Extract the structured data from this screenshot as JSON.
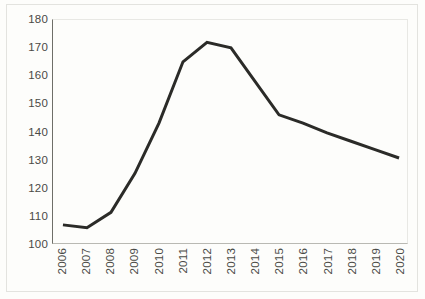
{
  "chart_data": {
    "type": "line",
    "title": "",
    "subtitle": "",
    "xlabel": "",
    "ylabel": "",
    "categories": [
      "2006",
      "2007",
      "2008",
      "2009",
      "2010",
      "2011",
      "2012",
      "2013",
      "2014",
      "2015",
      "2016",
      "2017",
      "2018",
      "2019",
      "2020"
    ],
    "values": [
      106.5,
      105.5,
      111.0,
      125.0,
      143.0,
      165.0,
      172.0,
      170.0,
      158.0,
      146.0,
      143.0,
      139.5,
      136.5,
      133.5,
      130.5
    ],
    "series": [
      {
        "name": "series-1",
        "values": [
          106.5,
          105.5,
          111.0,
          125.0,
          143.0,
          165.0,
          172.0,
          170.0,
          158.0,
          146.0,
          143.0,
          139.5,
          136.5,
          133.5,
          130.5
        ],
        "color": "#2b2b28",
        "line_width": 3
      }
    ],
    "ylim": [
      100,
      180
    ],
    "yticks": [
      100,
      110,
      120,
      130,
      140,
      150,
      160,
      170,
      180
    ],
    "ytick_labels": [
      "100",
      "110",
      "120",
      "130",
      "140",
      "150",
      "160",
      "170",
      "180"
    ],
    "xtick_labels": [
      "2006",
      "2007",
      "2008",
      "2009",
      "2010",
      "2011",
      "2012",
      "2013",
      "2014",
      "2015",
      "2016",
      "2017",
      "2018",
      "2019",
      "2020"
    ],
    "xtick_rotation": 90,
    "grid": false,
    "legend": false,
    "legend_position": "none",
    "markers": false,
    "annotations": []
  },
  "colors": {
    "line": "#2b2b28",
    "axis": "#6e6e68",
    "baseline": "#b9b9b3",
    "tick_text": "#4a4a46",
    "background": "#fdfdfb",
    "frame": "#e3e3df"
  }
}
